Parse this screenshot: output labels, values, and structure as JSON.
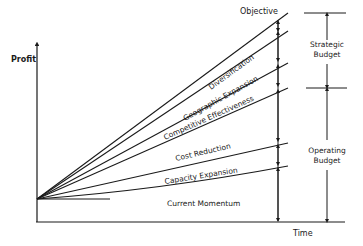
{
  "diagram": {
    "axes": {
      "y_label": "Profit",
      "x_label": "Time"
    },
    "top_label": "Objective",
    "layers": [
      {
        "label": "Diversification"
      },
      {
        "label": "Geographic Expansion"
      },
      {
        "label": "Competitive Effectiveness"
      },
      {
        "label": "Cost Reduction"
      },
      {
        "label": "Capacity Expansion"
      },
      {
        "label": "Current Momentum"
      }
    ],
    "budgets": {
      "strategic": {
        "line1": "Strategic",
        "line2": "Budget"
      },
      "operating": {
        "line1": "Operating",
        "line2": "Budget"
      }
    },
    "colors": {
      "ink": "#1a1a1a",
      "background": "#ffffff"
    }
  }
}
